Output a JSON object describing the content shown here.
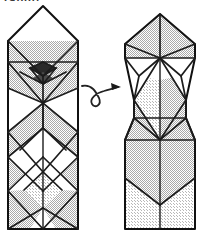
{
  "figure": {
    "kind": "origami-folding-diagram",
    "caption_fragment": "rabbit",
    "step_description": "Turn the model over (rotate) to reveal the reverse side.",
    "panels": [
      {
        "id": "before",
        "label": "left-origami-model",
        "description": "Tall narrow origami base seen from the front: a blank square-on-point head at top, a shaded collar band, a dense cluster of creases narrowing to a waist, then a long body covered with a diamond lattice of alternating shaded and white facets, ending in a crossed-X tail panel."
      },
      {
        "id": "after",
        "label": "right-origami-model",
        "description": "The same model after turning over: a broad shaded pentagon roof at top with fan creases converging to a point, a narrow shaded spindle midsection, a shaded trapezoid shoulder, and a plain tall body panel with a wide V crease near the bottom."
      }
    ],
    "arrow": {
      "name": "turn-over-arrow",
      "symbol": "looping-arrow",
      "meaning": "turn over",
      "direction": "left-to-right"
    },
    "colors": {
      "paper_front": "#ffffff",
      "paper_back": "#d2d2d2",
      "paper_back_light": "#e2e2e2",
      "crease_line": "#1c1c1c",
      "outline": "#111111",
      "arrow": "#222222",
      "background": "#ffffff"
    },
    "geometry": {
      "left_panel_bounds": [
        8,
        6,
        78,
        229
      ],
      "right_panel_bounds": [
        125,
        14,
        195,
        229
      ],
      "arrow_bounds": [
        82,
        78,
        122,
        110
      ]
    }
  }
}
